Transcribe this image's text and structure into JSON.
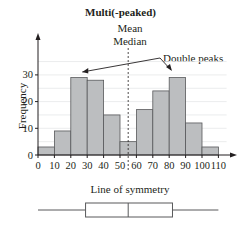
{
  "chart_data": {
    "type": "bar",
    "title": "Multi(-peaked)",
    "xlabel": "Line of symmetry",
    "ylabel": "Frequency",
    "bin_edges": [
      0,
      10,
      20,
      30,
      40,
      50,
      60,
      70,
      80,
      90,
      100,
      110
    ],
    "categories": [
      "0-10",
      "10-20",
      "20-30",
      "30-40",
      "40-50",
      "50-60",
      "60-70",
      "70-80",
      "80-90",
      "90-100",
      "100-110"
    ],
    "values": [
      3,
      9,
      29,
      28,
      15,
      5,
      17,
      24,
      29,
      12,
      3
    ],
    "x_ticks": [
      0,
      10,
      20,
      30,
      40,
      50,
      60,
      70,
      80,
      90,
      100,
      110
    ],
    "y_ticks": [
      0,
      10,
      20,
      30
    ],
    "ylim": [
      0,
      37
    ],
    "xlim": [
      0,
      115
    ],
    "grid": true,
    "bar_color": "#bcbec0",
    "annotations": [
      {
        "text": "Mean",
        "type": "label"
      },
      {
        "text": "Median",
        "type": "label"
      },
      {
        "text": "Double peaks",
        "type": "arrow-label",
        "targets": [
          25,
          85
        ]
      }
    ],
    "line_of_symmetry_x": 55,
    "boxplot": {
      "min": 0,
      "q1": 29,
      "median": 55,
      "q3": 82,
      "max": 110
    }
  },
  "labels": {
    "title": "Multi(-peaked)",
    "mean": "Mean",
    "median": "Median",
    "double_peaks": "Double peaks",
    "line_of_symmetry": "Line of symmetry",
    "y_axis": "Frequency"
  }
}
